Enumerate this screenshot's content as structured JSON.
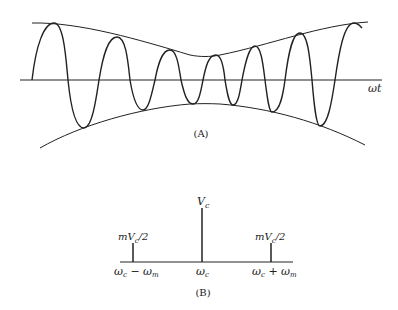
{
  "figure_a": {
    "caption": "(A)",
    "axis_label": "ωt",
    "description": "Amplitude-modulated carrier wave with upper and lower envelopes",
    "axis": {
      "x1": 20,
      "x2": 382,
      "y": 80
    },
    "peaks": [
      [
        54,
        23
      ],
      [
        117,
        37
      ],
      [
        170,
        50
      ],
      [
        216,
        55
      ],
      [
        255,
        46
      ],
      [
        300,
        33
      ],
      [
        354,
        23
      ]
    ],
    "troughs": [
      [
        84,
        128
      ],
      [
        143,
        110
      ],
      [
        193,
        104
      ],
      [
        233,
        105
      ],
      [
        272,
        112
      ],
      [
        320,
        126
      ]
    ]
  },
  "figure_b": {
    "caption": "(B)",
    "description": "Frequency spectrum of AM signal",
    "carrier": {
      "label_top": "V",
      "label_top_sub": "c",
      "freq_label": "ω",
      "freq_sub": "c"
    },
    "lower_sideband": {
      "label_top": "mV",
      "label_top_sub": "c",
      "label_top_tail": "/2",
      "freq_label": "ω",
      "freq_sub": "c",
      "freq_op": " − ω",
      "freq_sub2": "m"
    },
    "upper_sideband": {
      "label_top": "mV",
      "label_top_sub": "c",
      "label_top_tail": "/2",
      "freq_label": "ω",
      "freq_sub": "c",
      "freq_op": " + ω",
      "freq_sub2": "m"
    }
  },
  "colors": {
    "ink": "#222222",
    "background": "#ffffff"
  }
}
